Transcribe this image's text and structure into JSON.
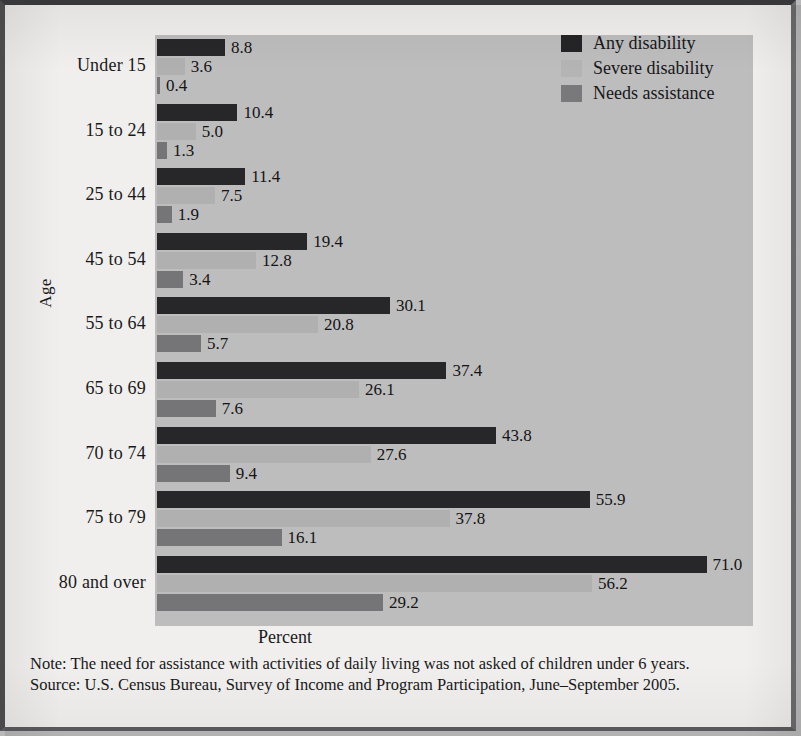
{
  "chart_data": {
    "type": "bar",
    "orientation": "horizontal",
    "title": "",
    "xlabel": "Percent",
    "ylabel": "Age",
    "xlim": [
      0,
      77
    ],
    "grid": false,
    "legend_position": "top-right",
    "categories": [
      "Under 15",
      "15 to 24",
      "25 to 44",
      "45 to 54",
      "55 to 64",
      "65 to 69",
      "70 to 74",
      "75 to 79",
      "80 and over"
    ],
    "series": [
      {
        "name": "Any disability",
        "color": "#27272a",
        "values": [
          8.8,
          10.4,
          11.4,
          19.4,
          30.1,
          37.4,
          43.8,
          55.9,
          71.0
        ],
        "labels": [
          "8.8",
          "10.4",
          "11.4",
          "19.4",
          "30.1",
          "37.4",
          "43.8",
          "55.9",
          "71.0"
        ]
      },
      {
        "name": "Severe disability",
        "color": "#b0b0b0",
        "values": [
          3.6,
          5.0,
          7.5,
          12.8,
          20.8,
          26.1,
          27.6,
          37.8,
          56.2
        ],
        "labels": [
          "3.6",
          "5.0",
          "7.5",
          "12.8",
          "20.8",
          "26.1",
          "27.6",
          "37.8",
          "56.2"
        ]
      },
      {
        "name": "Needs assistance",
        "color": "#757577",
        "values": [
          0.4,
          1.3,
          1.9,
          3.4,
          5.7,
          7.6,
          9.4,
          16.1,
          29.2
        ],
        "labels": [
          "0.4",
          "1.3",
          "1.9",
          "3.4",
          "5.7",
          "7.6",
          "9.4",
          "16.1",
          "29.2"
        ]
      }
    ]
  },
  "legend": {
    "items": [
      {
        "label": "Any disability"
      },
      {
        "label": "Severe disability"
      },
      {
        "label": "Needs assistance"
      }
    ]
  },
  "axes": {
    "x_title": "Percent",
    "y_title": "Age"
  },
  "notes": {
    "line1": "Note: The need for assistance with activities of daily living was not asked of children under 6 years.",
    "line2": "Source: U.S. Census Bureau, Survey of Income and Program Participation, June–September 2005."
  },
  "colors": {
    "any_disability": "#27272a",
    "severe_disability": "#b0b0b0",
    "needs_assistance": "#757577",
    "plot_background": "#bdbdbd",
    "page_background": "#f0efed"
  }
}
